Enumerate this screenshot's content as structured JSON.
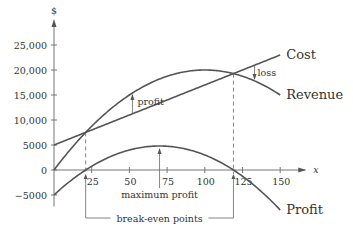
{
  "chart_data": {
    "type": "line",
    "title": "",
    "xlabel": "x",
    "ylabel": "$",
    "xlim": [
      0,
      160
    ],
    "ylim": [
      -6500,
      28000
    ],
    "x_ticks": [
      25,
      50,
      75,
      100,
      125,
      150
    ],
    "x_tick_labels": [
      "25",
      "50",
      "75",
      "100",
      "125",
      "150"
    ],
    "y_ticks": [
      25000,
      20000,
      15000,
      10000,
      5000,
      0,
      -5000
    ],
    "y_tick_labels": [
      "25,000",
      "20,000",
      "15,000",
      "10,000",
      "5000",
      "0",
      "−5000"
    ],
    "grid": false,
    "x_range": [
      0,
      150
    ],
    "series": [
      {
        "name": "Cost",
        "formula": "5000 + 120x",
        "x": [
          0,
          25,
          50,
          75,
          100,
          125,
          150
        ],
        "values": [
          5000,
          8000,
          11000,
          14000,
          17000,
          20000,
          23000
        ]
      },
      {
        "name": "Revenue",
        "formula": "400x - 2x^2",
        "x": [
          0,
          25,
          50,
          75,
          100,
          125,
          150
        ],
        "values": [
          0,
          8750,
          15000,
          18750,
          20000,
          18750,
          15000
        ]
      },
      {
        "name": "Profit",
        "formula": "-2x^2 + 280x - 5000",
        "x": [
          0,
          25,
          50,
          75,
          100,
          125,
          150
        ],
        "values": [
          -5000,
          750,
          4000,
          4750,
          3000,
          -2250,
          -8000
        ]
      }
    ],
    "coefficients": {
      "cost": {
        "fixed": 5000,
        "per_unit": 120
      },
      "revenue": {
        "a": 400,
        "b": 2
      },
      "profit": {
        "a": -2,
        "b": 280,
        "c": -5000
      }
    },
    "break_even_points": [
      21,
      119
    ],
    "maximum_profit_x": 70,
    "annotations": {
      "profit": {
        "text": "profit",
        "x": 52
      },
      "loss": {
        "text": "loss",
        "x": 133
      },
      "maximum_profit": "maximum profit",
      "break_even": "break-even points"
    },
    "legend": "curve labels at right end of each curve"
  }
}
